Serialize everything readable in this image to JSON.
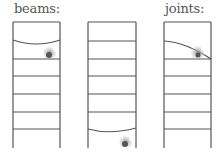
{
  "labels": {
    "beams": "beams:",
    "joints": "joints:"
  },
  "colors": {
    "frame": "#555555",
    "fire_outer": "#b0b0b0",
    "fire_inner": "#555555"
  },
  "frames": [
    {
      "id": "beams-frame-1",
      "failure": "beam sag near top with fire at right",
      "label": "beams"
    },
    {
      "id": "beams-frame-2",
      "failure": "beam sag near bottom with fire",
      "label": ""
    },
    {
      "id": "joints-frame",
      "failure": "joint failure at top-right with fire",
      "label": "joints"
    }
  ]
}
